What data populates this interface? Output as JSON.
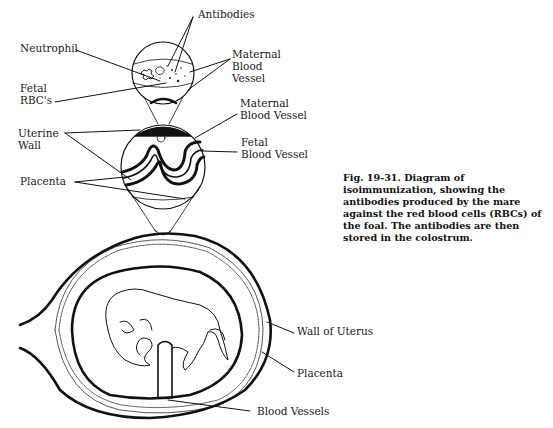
{
  "figure": {
    "caption": "Fig. 19-31. Diagram of isoimmunization, showing the antibodies produced by the mare against the red blood cells (RBCs) of the foal. The antibodies are then stored in the colostrum."
  },
  "labels": {
    "antibodies": "Antibodies",
    "neutrophil": "Neutrophil",
    "maternal_blood_vessel_top": [
      "Maternal",
      "Blood",
      "Vessel"
    ],
    "fetal_rbcs": [
      "Fetal",
      "RBC's"
    ],
    "maternal_blood_vessel_mid": [
      "Maternal",
      "Blood Vessel"
    ],
    "uterine_wall": [
      "Uterine",
      "Wall"
    ],
    "fetal_blood_vessel": [
      "Fetal",
      "Blood Vessel"
    ],
    "placenta_mid": "Placenta",
    "wall_of_uterus": "Wall of Uterus",
    "placenta_bottom": "Placenta",
    "blood_vessels": "Blood Vessels"
  },
  "colors": {
    "ink": "#111111",
    "background": "#ffffff"
  }
}
